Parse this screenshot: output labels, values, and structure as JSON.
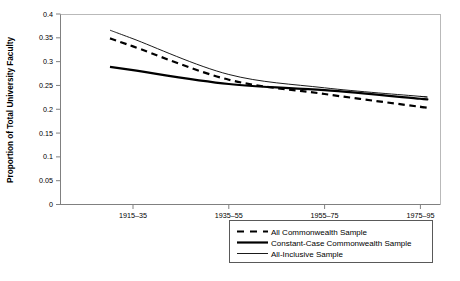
{
  "chart_data": {
    "type": "line",
    "title": "",
    "xlabel": "",
    "ylabel": "Proportion of Total University Faculty",
    "categories": [
      "1915–35",
      "1935–55",
      "1955–75",
      "1975–95"
    ],
    "ylim": [
      0,
      0.4
    ],
    "yticks": [
      "0",
      "0.05",
      "0.1",
      "0.15",
      "0.2",
      "0.25",
      "0.3",
      "0.35",
      "0.4"
    ],
    "ytick_values": [
      0,
      0.05,
      0.1,
      0.15,
      0.2,
      0.25,
      0.3,
      0.35,
      0.4
    ],
    "grid": false,
    "legend_position": "bottom-center",
    "series": [
      {
        "name": "All Commonwealth Sample",
        "style": "dashed",
        "width": 2.2,
        "color": "#000000",
        "values": [
          0.332,
          0.262,
          0.232,
          0.205
        ]
      },
      {
        "name": "Constant-Case Commonwealth Sample",
        "style": "solid",
        "width": 2.2,
        "color": "#000000",
        "values": [
          0.282,
          0.253,
          0.24,
          0.222
        ]
      },
      {
        "name": "All-Inclusive Sample",
        "style": "solid",
        "width": 0.9,
        "color": "#000000",
        "values": [
          0.348,
          0.273,
          0.245,
          0.227
        ]
      }
    ]
  },
  "axis": {
    "y_title": "Proportion of Total University Faculty"
  },
  "legend": {
    "items": [
      {
        "label": "All Commonwealth Sample",
        "key": "dashed-line-key"
      },
      {
        "label": "Constant-Case Commonwealth Sample",
        "key": "thick-solid-line-key"
      },
      {
        "label": "All-Inclusive Sample",
        "key": "thin-solid-line-key"
      }
    ]
  }
}
